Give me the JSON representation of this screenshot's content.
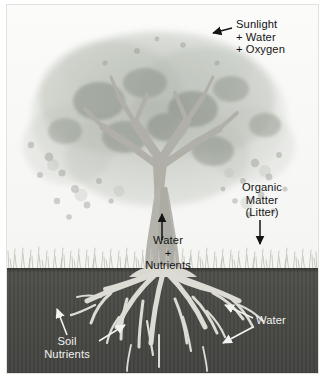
{
  "figure": {
    "type": "illustrated-diagram"
  },
  "scene": {
    "sky_color": "#f7f7f5",
    "soil_color": "#4a4a47",
    "grass_color": "#c9c9c4",
    "canopy_color": "#b9bcb6",
    "trunk_color": "#b4b4ad",
    "root_color": "#d7d7cf",
    "horizon_y": 263
  },
  "labels": {
    "sunlight": {
      "lines": [
        "Sunlight",
        "+ Water",
        "+ Oxygen"
      ],
      "text": "Sunlight\n+ Water\n+ Oxygen",
      "color": "#141414",
      "arrow": "points-left-into-canopy"
    },
    "organic_matter": {
      "lines": [
        "Organic",
        "Matter",
        "(Litter)"
      ],
      "text": "Organic\nMatter\n(Litter)",
      "color": "#141414",
      "arrow": "points-down-to-ground"
    },
    "water_nutrients": {
      "lines": [
        "Water",
        "+",
        "Nutrients"
      ],
      "text": "Water\n+\nNutrients",
      "color": "#141414",
      "arrow": "points-up-through-trunk"
    },
    "soil_nutrients": {
      "lines": [
        "Soil",
        "Nutrients"
      ],
      "text": "Soil\nNutrients",
      "color": "#f2f2f0",
      "arrow": "two-arrows-point-up-right-to-roots"
    },
    "water_roots": {
      "lines": [
        "Water"
      ],
      "text": "Water",
      "color": "#f2f2f0",
      "arrow": "two-arrows-point-left-to-roots"
    }
  }
}
